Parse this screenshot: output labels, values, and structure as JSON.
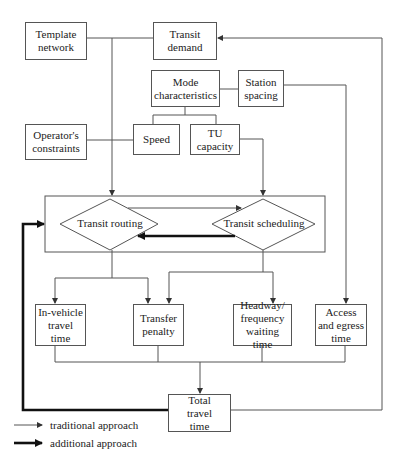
{
  "nodes": {
    "template_network": "Template network",
    "transit_demand": "Transit demand",
    "mode_characteristics": "Mode characteristics",
    "station_spacing": "Station spacing",
    "operators_constraints": "Operator's constraints",
    "speed": "Speed",
    "tu_capacity": "TU capacity",
    "transit_routing": "Transit routing",
    "transit_scheduling": "Transit scheduling",
    "in_vehicle_travel_time": "In-vehicle travel time",
    "transfer_penalty": "Transfer penalty",
    "headway_waiting_time": "Headway/ frequency waiting time",
    "access_egress_time": "Access and egress time",
    "total_travel_time": "Total travel time"
  },
  "legend": {
    "traditional": "traditional approach",
    "additional": "additional approach"
  },
  "colors": {
    "line": "#555555",
    "thick_line": "#111111"
  }
}
